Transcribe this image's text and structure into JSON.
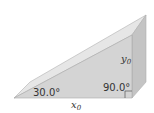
{
  "diagram": {
    "type": "wedge-inclined-plane",
    "angle_label": "30.0°",
    "right_angle_label": "90.0°",
    "height_label": "y",
    "height_subscript": "0",
    "base_label": "x",
    "base_subscript": "0",
    "colors": {
      "front_face": "#d4d4d4",
      "slope_face": "#e6e6e6",
      "right_face": "#c4c4c4",
      "edge": "#a8a8a8",
      "text": "#333333"
    }
  }
}
